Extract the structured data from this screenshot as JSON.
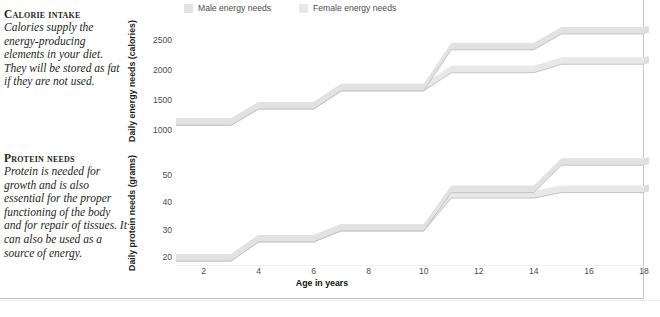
{
  "sidebar": {
    "blurbs": [
      {
        "heading": "Calorie intake",
        "body": "Calories supply the energy-producing elements in your diet. They will be stored as fat if they are not used."
      },
      {
        "heading": "Protein needs",
        "body": "Protein is needed for growth and is also essential for the proper functioning of the body and for repair of tissues. It can also be used as a source of energy."
      }
    ]
  },
  "legend": {
    "items": [
      {
        "label": "Male energy needs",
        "color": "#e2e2e2"
      },
      {
        "label": "Female energy needs",
        "color": "#e8e8e8"
      }
    ]
  },
  "axis": {
    "xlabel": "Age in years",
    "xticks": [
      2,
      4,
      6,
      8,
      10,
      12,
      14,
      16,
      18
    ]
  },
  "chart_data": [
    {
      "type": "line",
      "title": "Daily energy needs",
      "ylabel": "Daily energy needs (calories)",
      "xlabel": "Age in years",
      "yticks": [
        1000,
        1500,
        2000,
        2500
      ],
      "ylim": [
        750,
        2900
      ],
      "xlim": [
        1,
        18
      ],
      "grid": false,
      "legend_position": "top",
      "x": [
        1,
        3,
        4,
        6,
        7,
        10,
        11,
        14,
        15,
        18
      ],
      "series": [
        {
          "name": "Male energy needs",
          "color": "#e2e2e2",
          "values": [
            1150,
            1150,
            1420,
            1420,
            1720,
            1720,
            2400,
            2400,
            2660,
            2660
          ]
        },
        {
          "name": "Female energy needs",
          "color": "#e8e8e8",
          "values": [
            1150,
            1150,
            1420,
            1420,
            1720,
            1720,
            2020,
            2020,
            2160,
            2160
          ]
        }
      ]
    },
    {
      "type": "line",
      "title": "Daily protein needs",
      "ylabel": "Daily protein needs (grams)",
      "xlabel": "Age in years",
      "yticks": [
        20,
        30,
        40,
        50
      ],
      "ylim": [
        14,
        60
      ],
      "xlim": [
        1,
        18
      ],
      "grid": false,
      "legend_position": "top",
      "x": [
        1,
        3,
        4,
        6,
        7,
        10,
        11,
        14,
        15,
        18
      ],
      "series": [
        {
          "name": "Male energy needs",
          "color": "#e2e2e2",
          "values": [
            20,
            20,
            27,
            27,
            31,
            31,
            45,
            45,
            55,
            55
          ]
        },
        {
          "name": "Female energy needs",
          "color": "#e8e8e8",
          "values": [
            20,
            20,
            27,
            27,
            31,
            31,
            43,
            43,
            45,
            45
          ]
        }
      ]
    }
  ]
}
